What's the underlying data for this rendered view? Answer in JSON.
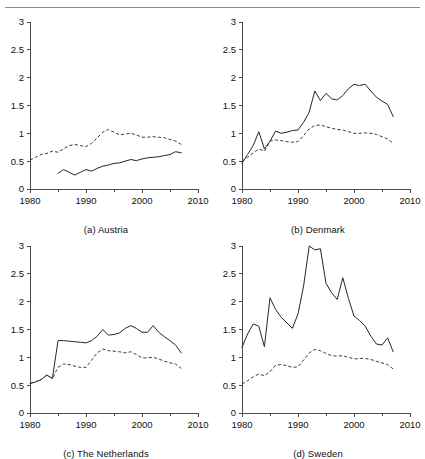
{
  "figure": {
    "has_header_rule": true,
    "background": "#ffffff",
    "axis_color": "#4a4a4a",
    "solid_series_color": "#262626",
    "dashed_series_color": "#3a3a3a"
  },
  "chart_data": [
    {
      "type": "line",
      "title": "(a) Austria",
      "xlabel": "",
      "ylabel": "",
      "xlim": [
        1980,
        2010
      ],
      "ylim": [
        0,
        3
      ],
      "xticks": [
        1980,
        1990,
        2000,
        2010
      ],
      "yticks": [
        0,
        0.5,
        1,
        1.5,
        2,
        2.5,
        3
      ],
      "xticklabels": [
        "1980",
        "1990",
        "2000",
        "2010"
      ],
      "yticklabels": [
        "0",
        "0.5",
        "1",
        "1.5",
        "2",
        "2.5",
        "3"
      ],
      "grid": false,
      "legend": "none",
      "series": [
        {
          "name": "dashed",
          "style": "dashed",
          "x": [
            1980,
            1981,
            1982,
            1983,
            1984,
            1985,
            1986,
            1987,
            1988,
            1989,
            1990,
            1991,
            1992,
            1993,
            1994,
            1995,
            1996,
            1997,
            1998,
            1999,
            2000,
            2001,
            2002,
            2003,
            2004,
            2005,
            2006,
            2007
          ],
          "values": [
            0.52,
            0.57,
            0.62,
            0.64,
            0.68,
            0.66,
            0.72,
            0.78,
            0.8,
            0.78,
            0.76,
            0.82,
            0.92,
            1.02,
            1.07,
            1.02,
            0.97,
            0.99,
            1.0,
            0.97,
            0.93,
            0.93,
            0.94,
            0.93,
            0.92,
            0.89,
            0.86,
            0.8
          ]
        },
        {
          "name": "solid",
          "style": "solid",
          "x": [
            1985,
            1986,
            1987,
            1988,
            1989,
            1990,
            1991,
            1992,
            1993,
            1994,
            1995,
            1996,
            1997,
            1998,
            1999,
            2000,
            2001,
            2002,
            2003,
            2004,
            2005,
            2006,
            2007
          ],
          "values": [
            0.28,
            0.35,
            0.3,
            0.25,
            0.3,
            0.35,
            0.32,
            0.37,
            0.41,
            0.43,
            0.46,
            0.47,
            0.5,
            0.53,
            0.51,
            0.54,
            0.56,
            0.57,
            0.58,
            0.6,
            0.62,
            0.67,
            0.65
          ]
        }
      ]
    },
    {
      "type": "line",
      "title": "(b) Denmark",
      "xlabel": "",
      "ylabel": "",
      "xlim": [
        1980,
        2010
      ],
      "ylim": [
        0,
        3
      ],
      "xticks": [
        1980,
        1990,
        2000,
        2010
      ],
      "yticks": [
        0,
        0.5,
        1,
        1.5,
        2,
        2.5,
        3
      ],
      "xticklabels": [
        "1980",
        "1990",
        "2000",
        "2010"
      ],
      "yticklabels": [
        "0",
        "0.5",
        "1",
        "1.5",
        "2",
        "2.5",
        "3"
      ],
      "grid": false,
      "legend": "none",
      "series": [
        {
          "name": "solid",
          "style": "solid",
          "x": [
            1980,
            1981,
            1982,
            1983,
            1984,
            1985,
            1986,
            1987,
            1988,
            1989,
            1990,
            1991,
            1992,
            1993,
            1994,
            1995,
            1996,
            1997,
            1998,
            1999,
            2000,
            2001,
            2002,
            2003,
            2004,
            2005,
            2006,
            2007
          ],
          "values": [
            0.46,
            0.62,
            0.78,
            1.03,
            0.72,
            0.86,
            1.04,
            1.0,
            1.02,
            1.05,
            1.06,
            1.2,
            1.38,
            1.76,
            1.59,
            1.72,
            1.62,
            1.6,
            1.68,
            1.8,
            1.88,
            1.86,
            1.88,
            1.76,
            1.65,
            1.58,
            1.52,
            1.3
          ]
        },
        {
          "name": "dashed",
          "style": "dashed",
          "x": [
            1980,
            1981,
            1982,
            1983,
            1984,
            1985,
            1986,
            1987,
            1988,
            1989,
            1990,
            1991,
            1992,
            1993,
            1994,
            1995,
            1996,
            1997,
            1998,
            1999,
            2000,
            2001,
            2002,
            2003,
            2004,
            2005,
            2006,
            2007
          ],
          "values": [
            0.5,
            0.57,
            0.65,
            0.72,
            0.68,
            0.86,
            0.88,
            0.87,
            0.85,
            0.84,
            0.85,
            0.96,
            1.08,
            1.14,
            1.15,
            1.12,
            1.09,
            1.07,
            1.06,
            1.03,
            1.0,
            1.0,
            1.01,
            1.0,
            0.98,
            0.94,
            0.9,
            0.82
          ]
        }
      ]
    },
    {
      "type": "line",
      "title": "(c) The Netherlands",
      "xlabel": "",
      "ylabel": "",
      "xlim": [
        1980,
        2010
      ],
      "ylim": [
        0,
        3
      ],
      "xticks": [
        1980,
        1990,
        2000,
        2010
      ],
      "yticks": [
        0,
        0.5,
        1,
        1.5,
        2,
        2.5,
        3
      ],
      "xticklabels": [
        "1980",
        "1990",
        "2000",
        "2010"
      ],
      "yticklabels": [
        "0",
        "0.5",
        "1",
        "1.5",
        "2",
        "2.5",
        "3"
      ],
      "grid": false,
      "legend": "none",
      "series": [
        {
          "name": "solid",
          "style": "solid",
          "x": [
            1980,
            1981,
            1982,
            1983,
            1984,
            1985,
            1986,
            1987,
            1988,
            1989,
            1990,
            1991,
            1992,
            1993,
            1994,
            1995,
            1996,
            1997,
            1998,
            1999,
            2000,
            2001,
            2002,
            2003,
            2004,
            2005,
            2006,
            2007
          ],
          "values": [
            0.53,
            0.56,
            0.6,
            0.68,
            0.62,
            1.3,
            1.3,
            1.29,
            1.28,
            1.27,
            1.26,
            1.3,
            1.38,
            1.5,
            1.4,
            1.41,
            1.44,
            1.52,
            1.57,
            1.52,
            1.45,
            1.45,
            1.57,
            1.45,
            1.37,
            1.3,
            1.22,
            1.08
          ]
        },
        {
          "name": "dashed",
          "style": "dashed",
          "x": [
            1980,
            1981,
            1982,
            1983,
            1984,
            1985,
            1986,
            1987,
            1988,
            1989,
            1990,
            1991,
            1992,
            1993,
            1994,
            1995,
            1996,
            1997,
            1998,
            1999,
            2000,
            2001,
            2002,
            2003,
            2004,
            2005,
            2006,
            2007
          ],
          "values": [
            0.53,
            0.56,
            0.6,
            0.68,
            0.62,
            0.82,
            0.88,
            0.87,
            0.84,
            0.82,
            0.82,
            0.95,
            1.08,
            1.15,
            1.12,
            1.11,
            1.1,
            1.08,
            1.1,
            1.05,
            0.99,
            0.99,
            1.0,
            0.97,
            0.93,
            0.9,
            0.88,
            0.8
          ]
        }
      ]
    },
    {
      "type": "line",
      "title": "(d) Sweden",
      "xlabel": "",
      "ylabel": "",
      "xlim": [
        1980,
        2010
      ],
      "ylim": [
        0,
        3
      ],
      "xticks": [
        1980,
        1990,
        2000,
        2010
      ],
      "yticks": [
        0,
        0.5,
        1,
        1.5,
        2,
        2.5,
        3
      ],
      "xticklabels": [
        "1980",
        "1990",
        "2000",
        "2010"
      ],
      "yticklabels": [
        "0",
        "0.5",
        "1",
        "1.5",
        "2",
        "2.5",
        "3"
      ],
      "grid": false,
      "legend": "none",
      "series": [
        {
          "name": "solid",
          "style": "solid",
          "x": [
            1980,
            1981,
            1982,
            1983,
            1984,
            1985,
            1986,
            1987,
            1988,
            1989,
            1990,
            1991,
            1992,
            1993,
            1994,
            1995,
            1996,
            1997,
            1998,
            1999,
            2000,
            2001,
            2002,
            2003,
            2004,
            2005,
            2006,
            2007
          ],
          "values": [
            1.18,
            1.42,
            1.6,
            1.56,
            1.19,
            2.07,
            1.86,
            1.72,
            1.62,
            1.52,
            1.78,
            2.28,
            3.0,
            2.93,
            2.95,
            2.33,
            2.16,
            2.04,
            2.43,
            2.06,
            1.74,
            1.66,
            1.56,
            1.38,
            1.24,
            1.22,
            1.35,
            1.1
          ]
        },
        {
          "name": "dashed",
          "style": "dashed",
          "x": [
            1980,
            1981,
            1982,
            1983,
            1984,
            1985,
            1986,
            1987,
            1988,
            1989,
            1990,
            1991,
            1992,
            1993,
            1994,
            1995,
            1996,
            1997,
            1998,
            1999,
            2000,
            2001,
            2002,
            2003,
            2004,
            2005,
            2006,
            2007
          ],
          "values": [
            0.52,
            0.58,
            0.65,
            0.7,
            0.67,
            0.74,
            0.86,
            0.87,
            0.85,
            0.82,
            0.83,
            0.95,
            1.08,
            1.14,
            1.12,
            1.07,
            1.03,
            1.02,
            1.03,
            1.0,
            0.97,
            0.98,
            0.98,
            0.96,
            0.93,
            0.9,
            0.87,
            0.79
          ]
        }
      ]
    }
  ]
}
